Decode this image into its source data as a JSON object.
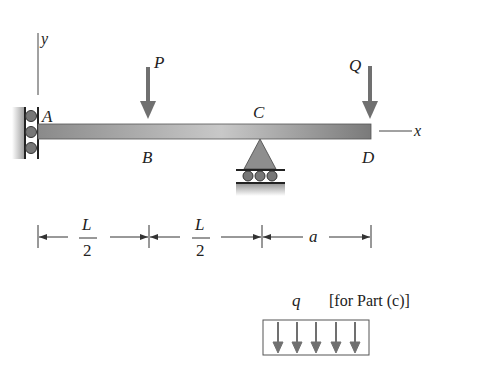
{
  "figure": {
    "type": "beam-diagram",
    "axes": {
      "x_label": "x",
      "y_label": "y"
    },
    "points": [
      {
        "id": "A",
        "label": "A",
        "description": "left end, roller support against wall"
      },
      {
        "id": "B",
        "label": "B",
        "description": "midpoint of first span, load P"
      },
      {
        "id": "C",
        "label": "C",
        "description": "pin/roller support"
      },
      {
        "id": "D",
        "label": "D",
        "description": "free end of overhang, load Q"
      }
    ],
    "loads": [
      {
        "id": "P",
        "label": "P",
        "at": "B",
        "direction": "down"
      },
      {
        "id": "Q",
        "label": "Q",
        "at": "D",
        "direction": "down"
      }
    ],
    "dimensions": [
      {
        "from": "A",
        "to": "B",
        "numerator": "L",
        "denominator": "2"
      },
      {
        "from": "B",
        "to": "C",
        "numerator": "L",
        "denominator": "2"
      },
      {
        "from": "C",
        "to": "D",
        "label": "a"
      }
    ],
    "distributed_load": {
      "label": "q",
      "note": "[for Part (c)]",
      "arrow_count": 5
    },
    "colors": {
      "beam": "#8c8c8c",
      "arrow": "#707070",
      "support": "#909090",
      "line": "#333333"
    }
  }
}
